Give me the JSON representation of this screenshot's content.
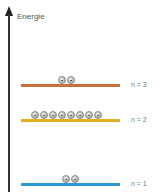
{
  "axis": {
    "label": "Energie"
  },
  "levels": [
    {
      "label": "n = 3",
      "color": "#c87038",
      "electrons": 2,
      "y": 85
    },
    {
      "label": "n = 2",
      "color": "#e8b020",
      "electrons": 8,
      "y": 120
    },
    {
      "label": "n = 1",
      "color": "#2a9ad8",
      "electrons": 2,
      "y": 184
    }
  ]
}
